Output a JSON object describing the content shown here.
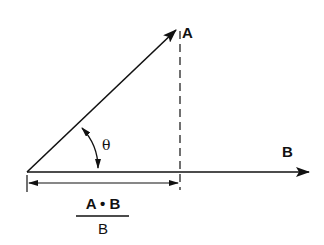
{
  "diagram": {
    "vector_a": {
      "label": "A"
    },
    "vector_b": {
      "label": "B"
    },
    "angle": {
      "label": "θ"
    },
    "projection": {
      "numerator": "A • B",
      "denominator": "B"
    },
    "colors": {
      "ink": "#111111",
      "background": "#ffffff"
    }
  }
}
